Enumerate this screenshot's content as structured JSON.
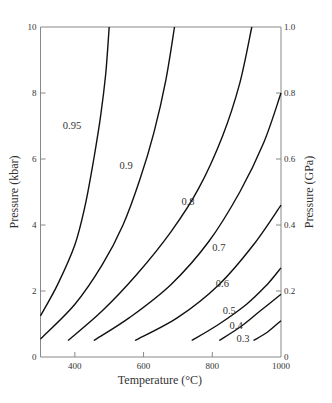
{
  "chart_data": {
    "type": "line",
    "title": "",
    "xlabel": "Temperature (°C)",
    "ylabel": "Pressure (kbar)",
    "ylabel_right": "Pressure (GPa)",
    "xlim": [
      300,
      1000
    ],
    "ylim": [
      0,
      10
    ],
    "ylim_right": [
      0,
      1.0
    ],
    "grid": false,
    "legend": "none (curves labelled inline)",
    "x_ticks": [
      400,
      600,
      800,
      1000
    ],
    "y_ticks": [
      0,
      2,
      4,
      6,
      8,
      10
    ],
    "y_ticks_right": [
      "0",
      "0.2",
      "0.4",
      "0.6",
      "0.8",
      "1.0"
    ],
    "series": [
      {
        "name": "0.95",
        "label_at": [
          430,
          7.0
        ],
        "points": [
          [
            300,
            1.25
          ],
          [
            350,
            2.2
          ],
          [
            400,
            3.4
          ],
          [
            430,
            4.6
          ],
          [
            455,
            6.0
          ],
          [
            475,
            7.3
          ],
          [
            490,
            8.6
          ],
          [
            500,
            10
          ]
        ]
      },
      {
        "name": "0.9",
        "label_at": [
          580,
          5.8
        ],
        "points": [
          [
            300,
            0.55
          ],
          [
            400,
            1.6
          ],
          [
            480,
            2.8
          ],
          [
            540,
            4.0
          ],
          [
            590,
            5.4
          ],
          [
            630,
            6.8
          ],
          [
            665,
            8.4
          ],
          [
            690,
            10
          ]
        ]
      },
      {
        "name": "0.8",
        "label_at": [
          760,
          4.7
        ],
        "points": [
          [
            380,
            0.5
          ],
          [
            480,
            1.4
          ],
          [
            580,
            2.5
          ],
          [
            680,
            3.8
          ],
          [
            760,
            5.1
          ],
          [
            830,
            6.7
          ],
          [
            880,
            8.3
          ],
          [
            915,
            10
          ]
        ]
      },
      {
        "name": "0.7",
        "label_at": [
          850,
          3.3
        ],
        "points": [
          [
            455,
            0.5
          ],
          [
            560,
            1.2
          ],
          [
            680,
            2.2
          ],
          [
            790,
            3.5
          ],
          [
            880,
            5.0
          ],
          [
            950,
            6.5
          ],
          [
            1000,
            8.0
          ]
        ]
      },
      {
        "name": "0.6",
        "label_at": [
          860,
          2.2
        ],
        "points": [
          [
            575,
            0.5
          ],
          [
            700,
            1.2
          ],
          [
            820,
            2.2
          ],
          [
            920,
            3.4
          ],
          [
            1000,
            4.6
          ]
        ]
      },
      {
        "name": "0.5",
        "label_at": [
          880,
          1.4
        ],
        "points": [
          [
            740,
            0.5
          ],
          [
            820,
            1.0
          ],
          [
            900,
            1.6
          ],
          [
            960,
            2.2
          ],
          [
            1000,
            2.7
          ]
        ]
      },
      {
        "name": "0.4",
        "label_at": [
          900,
          0.95
        ],
        "points": [
          [
            820,
            0.5
          ],
          [
            880,
            0.9
          ],
          [
            940,
            1.4
          ],
          [
            1000,
            1.9
          ]
        ]
      },
      {
        "name": "0.3",
        "label_at": [
          920,
          0.55
        ],
        "points": [
          [
            920,
            0.5
          ],
          [
            960,
            0.75
          ],
          [
            1000,
            1.1
          ]
        ]
      }
    ]
  },
  "axes": {
    "xlabel": "Temperature (°C)",
    "ylabel_left": "Pressure (kbar)",
    "ylabel_right": "Pressure (GPa)"
  }
}
